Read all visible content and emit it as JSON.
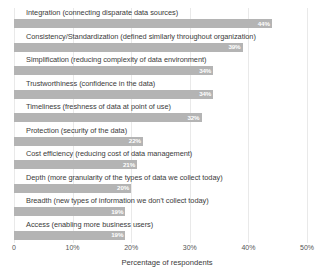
{
  "chart_data": {
    "type": "bar",
    "orientation": "horizontal",
    "title": "",
    "xlabel": "Percentage of respondents",
    "ylabel": "",
    "xlim": [
      0,
      50
    ],
    "grid": true,
    "legend": "none",
    "bar_color": "#b4b4b4",
    "value_label_color": "#ffffff",
    "xticks": [
      {
        "value": 0,
        "label": "0"
      },
      {
        "value": 10,
        "label": "10%"
      },
      {
        "value": 20,
        "label": "20%"
      },
      {
        "value": 30,
        "label": "30%"
      },
      {
        "value": 40,
        "label": "40%"
      },
      {
        "value": 50,
        "label": "50%"
      }
    ],
    "categories": [
      "Integration (connecting disparate data sources)",
      "Consistency/Standardization (defined similarly throughout organization)",
      "Simplification (reducing complexity of data environment)",
      "Trustworthiness (confidence in the data)",
      "Timeliness (freshness of data at point of use)",
      "Protection (security of the data)",
      "Cost efficiency (reducing cost of data management)",
      "Depth (more granularity of the types of data we collect today)",
      "Breadth (new types of information we don't collect today)",
      "Access (enabling more business users)"
    ],
    "values": [
      44,
      39,
      34,
      34,
      32,
      22,
      21,
      20,
      19,
      19
    ],
    "value_labels": [
      "44%",
      "39%",
      "34%",
      "34%",
      "32%",
      "22%",
      "21%",
      "20%",
      "19%",
      "19%"
    ]
  }
}
